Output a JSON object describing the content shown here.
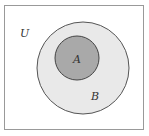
{
  "diagram": {
    "type": "venn",
    "universe": {
      "label": "U",
      "fill": "#ffffff",
      "stroke": "#999999"
    },
    "outer_set": {
      "label": "B",
      "fill": "#e9e9e9",
      "stroke": "#555555"
    },
    "inner_set": {
      "label": "A",
      "fill": "#a9a9a9",
      "stroke": "#444444"
    }
  }
}
